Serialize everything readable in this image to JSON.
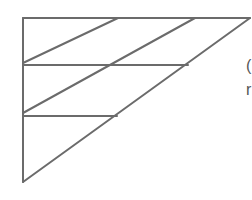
{
  "diagram": {
    "type": "line-drawing",
    "stroke_color": "#6b6b6b",
    "background": "#ffffff",
    "triangle": {
      "top_left": [
        23,
        18
      ],
      "top_right": [
        250,
        18
      ],
      "bottom_left": [
        23,
        182
      ]
    },
    "horizontal_lines": [
      {
        "y": 65,
        "x1": 23,
        "x2": 188
      },
      {
        "y": 116,
        "x1": 23,
        "x2": 117
      }
    ],
    "diagonal_lines": [
      {
        "x1": 118,
        "y1": 18,
        "x2": 23,
        "y2": 63
      },
      {
        "x1": 195,
        "y1": 18,
        "x2": 23,
        "y2": 113
      }
    ],
    "clipped_text": [
      "(",
      "r"
    ]
  }
}
